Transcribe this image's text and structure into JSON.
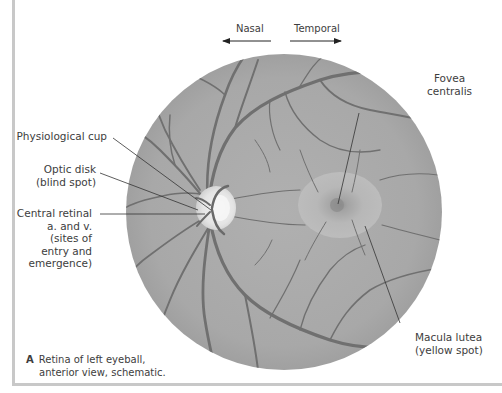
{
  "figure": {
    "direction": {
      "left_label": "Nasal",
      "right_label": "Temporal"
    },
    "labels": {
      "physiological_cup": "Physiological cup",
      "optic_disk_line1": "Optic disk",
      "optic_disk_line2": "(blind spot)",
      "central_retinal_line1": "Central retinal",
      "central_retinal_line2": "a. and v.",
      "central_retinal_line3": "(sites of",
      "central_retinal_line4": "entry and",
      "central_retinal_line5": "emergence)",
      "fovea_line1": "Fovea",
      "fovea_line2": "centralis",
      "macula_line1": "Macula lutea",
      "macula_line2": "(yellow spot)"
    },
    "caption": {
      "letter": "A",
      "line1": "Retina of left eyeball,",
      "line2": "anterior view, schematic."
    },
    "colors": {
      "fundus": "#a9a9a9",
      "vessel": "#6f6f6f",
      "disk": "#e6e6e6",
      "frame": "#c8c8c8"
    }
  }
}
